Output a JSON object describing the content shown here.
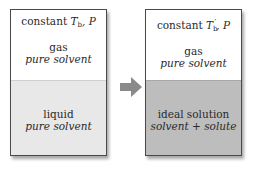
{
  "left_box": {
    "condition_prefix": "constant ",
    "condition_T": "T",
    "condition_T_sub": "b",
    "condition_T_prime": "",
    "condition_suffix": ", P",
    "upper_phase": "gas",
    "upper_composition": "pure solvent",
    "lower_phase": "liquid",
    "lower_composition": "pure solvent"
  },
  "right_box": {
    "condition_prefix": "constant ",
    "condition_T": "T",
    "condition_T_sub": "b",
    "condition_T_prime": "′",
    "condition_suffix": ", P",
    "upper_phase": "gas",
    "upper_composition": "pure solvent",
    "lower_phase": "ideal solution",
    "lower_composition": "solvent + solute"
  },
  "arrow": {
    "icon": "right-arrow-icon",
    "color": "#8a8a8a"
  },
  "colors": {
    "border": "#4a4a4a",
    "pure_liquid_fill": "#e8e8e8",
    "solution_fill": "#bdbdbd",
    "gas_fill": "#ffffff"
  }
}
